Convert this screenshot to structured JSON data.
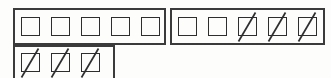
{
  "widget": {
    "name": "tally-checkbox-grid",
    "description": "Rows of square tally cells; some cells are struck through with a diagonal slash",
    "colors": {
      "background": "#fdfdfc",
      "border": "#3b3b3b",
      "cell_border": "#2e2e2e",
      "slash": "#2e2e2e"
    },
    "totals": {
      "cells_total": 13,
      "cells_empty": 7,
      "cells_marked": 6
    },
    "groups": [
      {
        "id": "group-a",
        "label": "Row 1 Group 1",
        "cells": [
          {
            "id": "a1",
            "state": "empty"
          },
          {
            "id": "a2",
            "state": "empty"
          },
          {
            "id": "a3",
            "state": "empty"
          },
          {
            "id": "a4",
            "state": "empty"
          },
          {
            "id": "a5",
            "state": "empty"
          }
        ]
      },
      {
        "id": "group-b",
        "label": "Row 1 Group 2",
        "cells": [
          {
            "id": "b1",
            "state": "empty"
          },
          {
            "id": "b2",
            "state": "empty"
          },
          {
            "id": "b3",
            "state": "marked"
          },
          {
            "id": "b4",
            "state": "marked"
          },
          {
            "id": "b5",
            "state": "marked"
          }
        ]
      },
      {
        "id": "group-c",
        "label": "Row 2 Group 1",
        "cells": [
          {
            "id": "c1",
            "state": "marked"
          },
          {
            "id": "c2",
            "state": "marked"
          },
          {
            "id": "c3",
            "state": "marked"
          }
        ]
      }
    ]
  }
}
